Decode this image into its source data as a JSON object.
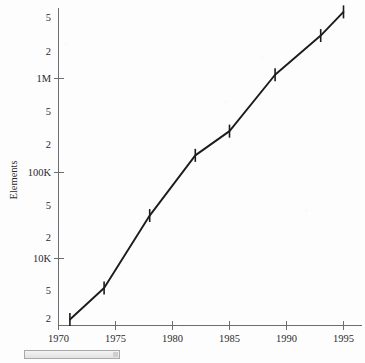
{
  "chart_data": {
    "type": "line",
    "title": "",
    "subtitle": "",
    "xlabel": "",
    "ylabel": "Elements",
    "yscale": "log",
    "xscale": "linear",
    "grid": false,
    "legend": null,
    "xlim": [
      1970,
      1996
    ],
    "ylim": [
      2000,
      6000000
    ],
    "x_ticks": [
      {
        "value": 1970,
        "label": "1970"
      },
      {
        "value": 1975,
        "label": "1975"
      },
      {
        "value": 1980,
        "label": "1980"
      },
      {
        "value": 1985,
        "label": "1985"
      },
      {
        "value": 1990,
        "label": "1990"
      },
      {
        "value": 1995,
        "label": "1995"
      }
    ],
    "y_ticks": [
      {
        "value": 5000000,
        "label": "5",
        "major": false
      },
      {
        "value": 2000000,
        "label": "2",
        "major": false
      },
      {
        "value": 1000000,
        "label": "1M",
        "major": true
      },
      {
        "value": 500000,
        "label": "5",
        "major": false
      },
      {
        "value": 200000,
        "label": "2",
        "major": false
      },
      {
        "value": 100000,
        "label": "100K",
        "major": true
      },
      {
        "value": 50000,
        "label": "5",
        "major": false
      },
      {
        "value": 20000,
        "label": "2",
        "major": false
      },
      {
        "value": 10000,
        "label": "10K",
        "major": true
      },
      {
        "value": 5000,
        "label": "5",
        "major": false
      },
      {
        "value": 2000,
        "label": "2",
        "major": false
      }
    ],
    "x": [
      1971,
      1974,
      1978,
      1982,
      1985,
      1989,
      1993,
      1995
    ],
    "values": [
      2100,
      4700,
      30000,
      140000,
      260000,
      1100000,
      3000000,
      5500000
    ],
    "error_bars": true,
    "series": [
      {
        "name": "Elements",
        "x": [
          1971,
          1974,
          1978,
          1982,
          1985,
          1989,
          1993,
          1995
        ],
        "values": [
          2100,
          4700,
          30000,
          140000,
          260000,
          1100000,
          3000000,
          5500000
        ]
      }
    ],
    "line_color": "#1c1c1c",
    "axis_color": "#6e6e70"
  },
  "figure": {
    "y_axis_title": "Elements"
  },
  "bottom_widget": {
    "name": "scroll-bar",
    "label": ""
  }
}
